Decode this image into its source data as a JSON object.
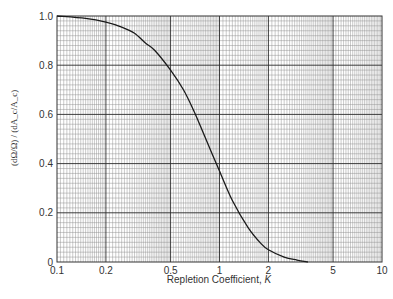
{
  "chart_data": {
    "type": "line",
    "title": "",
    "xlabel": "Repletion Coefficient, K",
    "xlabel_main": "Repletion Coefficient, ",
    "xlabel_var": "K",
    "ylabel": "(dΩ/Ω) / (dA_c/A_c)",
    "ylabel_parts": {
      "num_top": "dΩ",
      "num_bot": "Ω",
      "den_top": "dA",
      "den_sub": "c",
      "den_bot": "A",
      "den_bot_sub": "c"
    },
    "xscale": "log",
    "xlim": [
      0.1,
      10
    ],
    "ylim": [
      0,
      1.0
    ],
    "grid": true,
    "legend": "none",
    "x_ticks": [
      0.1,
      0.2,
      0.5,
      1,
      2,
      5,
      10
    ],
    "x_tick_labels": [
      "0.1",
      "0.2",
      "0.5",
      "1",
      "2",
      "5",
      "10"
    ],
    "y_ticks": [
      0,
      0.2,
      0.4,
      0.6,
      0.8,
      1.0
    ],
    "y_tick_labels": [
      "0",
      "0.2",
      "0.4",
      "0.6",
      "0.8",
      "1.0"
    ],
    "series": [
      {
        "name": "curve",
        "x": [
          0.1,
          0.15,
          0.2,
          0.25,
          0.3,
          0.35,
          0.4,
          0.5,
          0.6,
          0.7,
          0.8,
          0.9,
          1.0,
          1.2,
          1.5,
          1.8,
          2.0,
          2.5,
          3.0,
          3.5
        ],
        "y": [
          1.0,
          0.99,
          0.975,
          0.955,
          0.93,
          0.89,
          0.86,
          0.78,
          0.7,
          0.61,
          0.52,
          0.44,
          0.37,
          0.25,
          0.14,
          0.075,
          0.05,
          0.02,
          0.008,
          0.0
        ]
      }
    ]
  },
  "colors": {
    "curve": "#1a1a1a",
    "major_grid": "#2a2a2a",
    "minor_grid": "#8a8a8a",
    "frame": "#333333"
  }
}
